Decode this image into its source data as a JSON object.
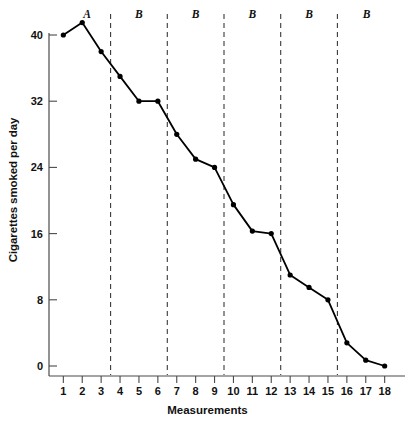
{
  "chart_data": {
    "type": "line",
    "title": "",
    "xlabel": "Measurements",
    "ylabel": "Cigarettes smoked per day",
    "x": [
      1,
      2,
      3,
      4,
      5,
      6,
      7,
      8,
      9,
      10,
      11,
      12,
      13,
      14,
      15,
      16,
      17,
      18
    ],
    "values": [
      40,
      41.5,
      38,
      35,
      32,
      32,
      28,
      25,
      24,
      19.5,
      16.3,
      16,
      11,
      9.5,
      8,
      2.8,
      0.7,
      0
    ],
    "series": [
      {
        "name": "Cigarettes smoked per day",
        "values": [
          40,
          41.5,
          38,
          35,
          32,
          32,
          28,
          25,
          24,
          19.5,
          16.3,
          16,
          11,
          9.5,
          8,
          2.8,
          0.7,
          0
        ]
      }
    ],
    "xtick_labels": [
      "1",
      "2",
      "3",
      "4",
      "5",
      "6",
      "7",
      "8",
      "9",
      "10",
      "11",
      "12",
      "13",
      "14",
      "15",
      "16",
      "17",
      "18"
    ],
    "ytick_labels": [
      "0",
      "8",
      "16",
      "24",
      "32",
      "40"
    ],
    "yticks": [
      0,
      8,
      16,
      24,
      32,
      40
    ],
    "ylim": [
      0,
      43
    ],
    "xlim": [
      0.4,
      18.6
    ],
    "grid": false,
    "legend": "none",
    "marker": "circle",
    "line_color": "#000000",
    "marker_color": "#000000",
    "phases": [
      {
        "label": "A",
        "start": 1,
        "end": 3.5
      },
      {
        "label": "B",
        "start": 3.5,
        "end": 6.5
      },
      {
        "label": "B",
        "start": 6.5,
        "end": 9.5
      },
      {
        "label": "B",
        "start": 9.5,
        "end": 12.5
      },
      {
        "label": "B",
        "start": 12.5,
        "end": 15.5
      },
      {
        "label": "B",
        "start": 15.5,
        "end": 18.6
      }
    ],
    "phase_dividers": [
      3.5,
      6.5,
      9.5,
      12.5,
      15.5
    ],
    "divider_color": "#3a3a3a",
    "axis_color": "#4a4a4a"
  }
}
